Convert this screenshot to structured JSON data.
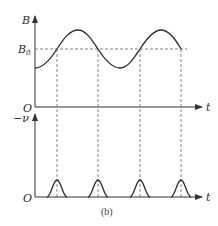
{
  "figure": {
    "caption": "(b)",
    "colors": {
      "curve": "#2a2a2a",
      "axis": "#333333",
      "dashed": "#666666",
      "background": "#ffffff"
    }
  },
  "upper_plot": {
    "y_axis_label": "B",
    "y_reference_label": "B",
    "y_reference_subscript": "0",
    "origin_label": "O",
    "x_axis_label": "t",
    "description": "Sinusoidal magnetic field B(t) oscillating about B0"
  },
  "lower_plot": {
    "y_axis_label": "−ν",
    "origin_label": "O",
    "x_axis_label": "t",
    "description": "Sharp pulses occurring when B crosses B0"
  },
  "crossing_times_px": [
    57,
    98,
    140,
    181
  ]
}
